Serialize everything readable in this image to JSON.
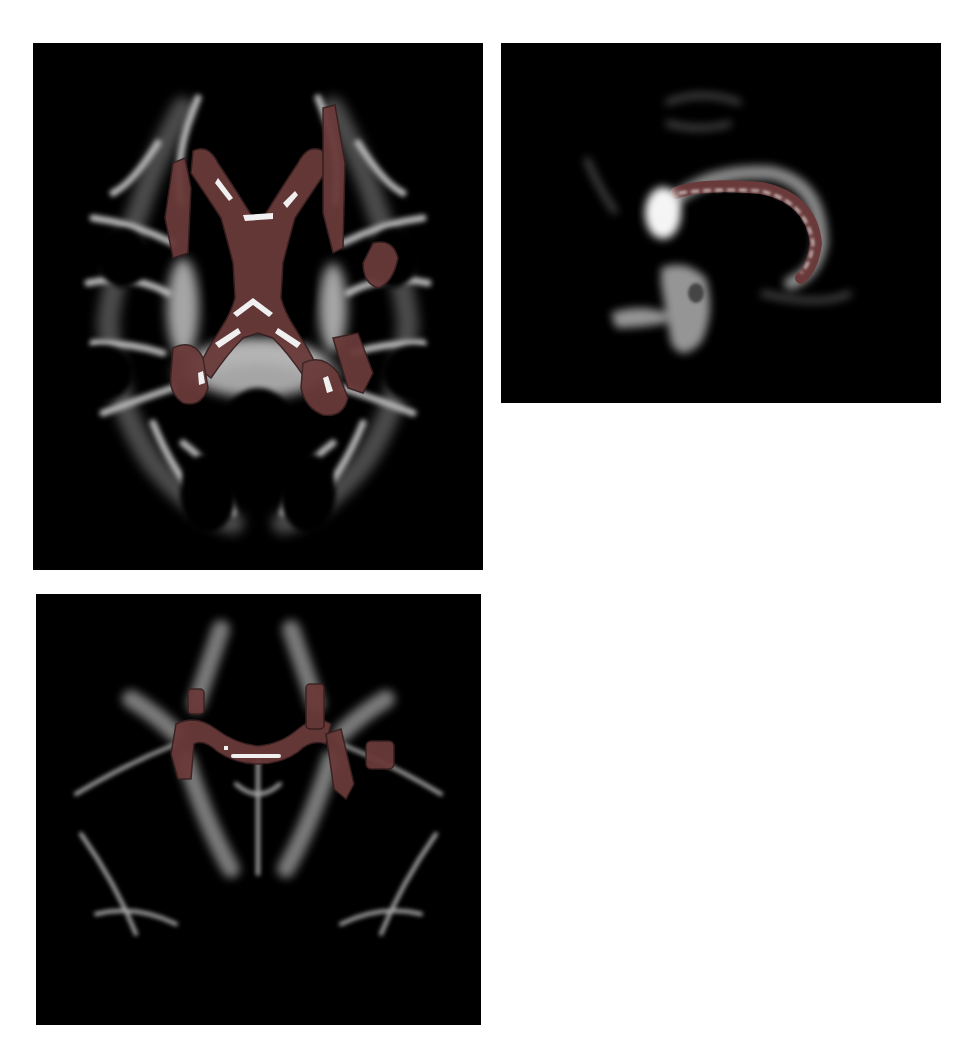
{
  "figure": {
    "panels": [
      {
        "id": "axial",
        "label": "Axial slice",
        "overlay_regions": [
          "genu of corpus callosum",
          "body of corpus callosum",
          "splenium of corpus callosum",
          "anterior corona radiata",
          "posterior thalamic radiation"
        ]
      },
      {
        "id": "sagittal",
        "label": "Midsagittal slice",
        "overlay_regions": [
          "corpus callosum (genu to splenium)"
        ]
      },
      {
        "id": "coronal",
        "label": "Coronal slice",
        "overlay_regions": [
          "corpus callosum body",
          "bilateral corona radiata"
        ]
      }
    ],
    "colors": {
      "background": "#000000",
      "white_matter": "#d8d8d8",
      "overlay": "#6a3a3a",
      "overlay_outline": "#3a2020",
      "skeleton": "#f0f0f0"
    },
    "caption": ""
  }
}
